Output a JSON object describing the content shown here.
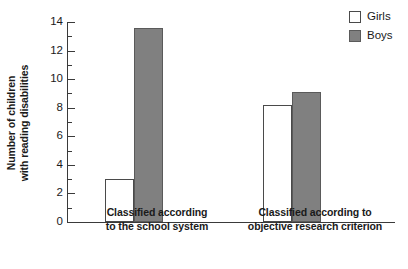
{
  "chart_data": {
    "type": "bar",
    "title": "",
    "xlabel": "",
    "ylabel": "Number of children with reading disabilities",
    "ylabel_line1": "Number of children",
    "ylabel_line2": "with reading disabilities",
    "categories": [
      "Classified according to the school system",
      "Classified according to objective research criterion"
    ],
    "category_lines": [
      [
        "Classified according",
        "to the school system"
      ],
      [
        "Classified according to",
        "objective research criterion"
      ]
    ],
    "series": [
      {
        "name": "Girls",
        "values": [
          3.0,
          8.2
        ],
        "color": "#ffffff"
      },
      {
        "name": "Boys",
        "values": [
          13.6,
          9.1
        ],
        "color": "#808080"
      }
    ],
    "ylim": [
      0,
      14
    ],
    "ytick_values": [
      0,
      2,
      4,
      6,
      8,
      10,
      12,
      14
    ],
    "ytick_labels": [
      "0",
      "2",
      "4",
      "6",
      "8",
      "10",
      "12",
      "14"
    ],
    "yminor_values": [
      1,
      3,
      5,
      7,
      9,
      11,
      13
    ],
    "grid": false,
    "legend_position": "top-right",
    "legend": [
      "Girls",
      "Boys"
    ]
  },
  "legend": {
    "entries": [
      {
        "label": "Girls",
        "swatch": "white-square"
      },
      {
        "label": "Boys",
        "swatch": "gray-square"
      }
    ]
  }
}
